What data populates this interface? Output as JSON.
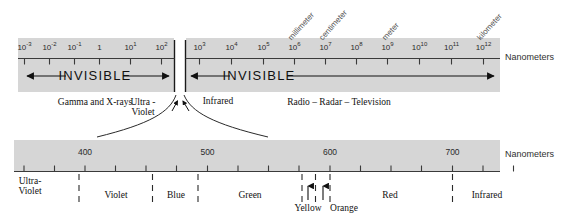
{
  "figure": {
    "unit_label_top": "Nanometers",
    "unit_label_bottom": "Nanometers",
    "band_fill": "#d6d6d6",
    "axis_color": "#3a3a3a"
  },
  "chart_data": {
    "type": "bar",
    "xlabel": "Nanometers",
    "ylabel": "",
    "grid": false,
    "legend": false,
    "top_axis": {
      "scale": "log10",
      "unit": "Nanometers",
      "tick_labels": [
        "10⁻³",
        "10⁻²",
        "10⁻¹",
        "1",
        "10¹",
        "10²",
        "10³",
        "10⁴",
        "10⁵",
        "10⁶",
        "10⁷",
        "10⁸",
        "10⁹",
        "10¹⁰",
        "10¹¹",
        "10¹²"
      ],
      "exponents": [
        -3,
        -2,
        -1,
        0,
        1,
        2,
        3,
        4,
        5,
        6,
        7,
        8,
        9,
        10,
        11,
        12
      ],
      "annotations": [
        {
          "label": "millimeter",
          "exponent": 6
        },
        {
          "label": "centimeter",
          "exponent": 7
        },
        {
          "label": "meter",
          "exponent": 9
        },
        {
          "label": "kilometer",
          "exponent": 12
        }
      ],
      "regions": [
        {
          "label": "INVISIBLE",
          "caption": "Gamma and X-rays",
          "from_exponent": -3.4,
          "to_exponent": 2.25
        },
        {
          "label": "INVISIBLE",
          "caption": "Radio – Radar – Television",
          "from_exponent": 2.85,
          "to_exponent": 12.45
        }
      ],
      "visible_gap": {
        "from_exponent": 2.25,
        "to_exponent": 2.85,
        "left_caption": "Ultra -\nViolet",
        "right_caption": "Infrared"
      }
    },
    "bottom_axis": {
      "scale": "linear",
      "unit": "Nanometers",
      "xlim": [
        350,
        775
      ],
      "tick_step": 25,
      "ticks": [
        350,
        375,
        400,
        425,
        450,
        475,
        500,
        525,
        550,
        575,
        600,
        625,
        650,
        675,
        700,
        725,
        750,
        775
      ],
      "tick_labels": [
        {
          "value": 400,
          "text": "400"
        },
        {
          "value": 500,
          "text": "500"
        },
        {
          "value": 600,
          "text": "600"
        },
        {
          "value": 700,
          "text": "700"
        }
      ],
      "color_bands": [
        {
          "name": "Ultra-\nViolet",
          "from": 350,
          "to": 395,
          "arrow": false
        },
        {
          "name": "Violet",
          "from": 395,
          "to": 455,
          "arrow": false
        },
        {
          "name": "Blue",
          "from": 455,
          "to": 492,
          "arrow": false
        },
        {
          "name": "Green",
          "from": 492,
          "to": 577,
          "arrow": false
        },
        {
          "name": "Yellow",
          "from": 577,
          "to": 588,
          "arrow": true
        },
        {
          "name": "Orange",
          "from": 588,
          "to": 600,
          "arrow": true
        },
        {
          "name": "Red",
          "from": 600,
          "to": 700,
          "arrow": false
        },
        {
          "name": "Infrared",
          "from": 700,
          "to": 775,
          "arrow": false
        }
      ],
      "boundaries": [
        395,
        455,
        492,
        577,
        588,
        600,
        700
      ]
    }
  },
  "top_scale": {
    "unit": "Nanometers",
    "ticks": [
      {
        "id": "t-3",
        "text": "10",
        "sup": "-3",
        "x": 24.5
      },
      {
        "id": "t-2",
        "text": "10",
        "sup": "-2",
        "x": 49.5
      },
      {
        "id": "t-1",
        "text": "10",
        "sup": "-1",
        "x": 74.5
      },
      {
        "id": "t0",
        "text": "1",
        "sup": "",
        "x": 99.5
      },
      {
        "id": "t1",
        "text": "10",
        "sup": "1",
        "x": 130.5
      },
      {
        "id": "t2",
        "text": "10",
        "sup": "2",
        "x": 161.5
      },
      {
        "id": "t3",
        "text": "10",
        "sup": "3",
        "x": 199.5
      },
      {
        "id": "t4",
        "text": "10",
        "sup": "4",
        "x": 231.5
      },
      {
        "id": "t5",
        "text": "10",
        "sup": "5",
        "x": 263.5
      },
      {
        "id": "t6",
        "text": "10",
        "sup": "6",
        "x": 294.5
      },
      {
        "id": "t7",
        "text": "10",
        "sup": "7",
        "x": 325.5
      },
      {
        "id": "t8",
        "text": "10",
        "sup": "8",
        "x": 356.5
      },
      {
        "id": "t9",
        "text": "10",
        "sup": "9",
        "x": 387.5
      },
      {
        "id": "t10",
        "text": "10",
        "sup": "10",
        "x": 419.5
      },
      {
        "id": "t11",
        "text": "10",
        "sup": "11",
        "x": 451.5
      },
      {
        "id": "t12",
        "text": "10",
        "sup": "12",
        "x": 483.5
      }
    ],
    "rotated_labels": [
      {
        "text": "millimeter",
        "x": 293.0
      },
      {
        "text": "centimeter",
        "x": 324.0
      },
      {
        "text": "meter",
        "x": 387.0
      },
      {
        "text": "kilometer",
        "x": 482.0
      }
    ],
    "left_region": {
      "label": "INVISIBLE",
      "caption": "Gamma and X-rays"
    },
    "right_region": {
      "label": "INVISIBLE",
      "caption": "Radio – Radar – Television"
    },
    "gap_left_caption_line1": "Ultra -",
    "gap_left_caption_line2": "Violet",
    "gap_right_caption": "Infrared"
  },
  "bottom_scale": {
    "unit": "Nanometers",
    "number_labels": [
      {
        "text": "400",
        "x": 85.0
      },
      {
        "text": "500",
        "x": 207.5
      },
      {
        "text": "600",
        "x": 330.0
      },
      {
        "text": "700",
        "x": 452.5
      }
    ],
    "tick_xs": [
      24.0,
      54.5,
      85.0,
      115.5,
      146.0,
      176.5,
      207.5,
      238.0,
      268.5,
      299.0,
      330.0,
      360.5,
      391.0,
      421.5,
      452.5,
      483.0,
      513.5
    ],
    "boundary_xs": [
      79.0,
      152.5,
      198.0,
      302.0,
      315.5,
      330.0,
      452.5
    ],
    "colors": [
      {
        "name": "Ultra-",
        "name2": "Violet",
        "x": 30.0,
        "two_line": true,
        "arrow": false
      },
      {
        "name": "Violet",
        "name2": "",
        "x": 116.0,
        "two_line": false,
        "arrow": false
      },
      {
        "name": "Blue",
        "name2": "",
        "x": 176.0,
        "two_line": false,
        "arrow": false
      },
      {
        "name": "Green",
        "name2": "",
        "x": 250.0,
        "two_line": false,
        "arrow": false
      },
      {
        "name": "Yellow",
        "name2": "",
        "x": 308.0,
        "two_line": false,
        "arrow": true,
        "arrow_x": 308.0
      },
      {
        "name": "Orange",
        "name2": "",
        "x": 344.0,
        "two_line": false,
        "arrow": true,
        "arrow_x": 323.0
      },
      {
        "name": "Red",
        "name2": "",
        "x": 390.0,
        "two_line": false,
        "arrow": false
      },
      {
        "name": "Infrared",
        "name2": "",
        "x": 487.0,
        "two_line": false,
        "arrow": false
      }
    ]
  }
}
